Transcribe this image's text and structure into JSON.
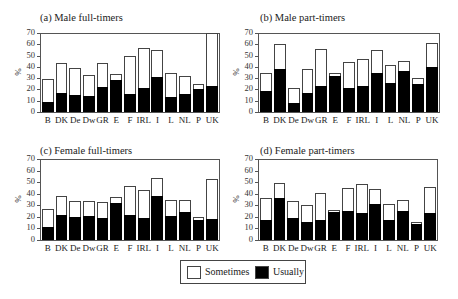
{
  "legend": {
    "sometimes_label": "Sometimes",
    "usually_label": "Usually",
    "sometimes_color": "#ffffff",
    "usually_color": "#000000"
  },
  "chart_data": [
    {
      "type": "bar",
      "stacked": true,
      "title": "(a) Male full-timers",
      "xlabel": "",
      "ylabel": "%",
      "ylim": [
        0,
        70
      ],
      "yticks": [
        0,
        10,
        20,
        30,
        40,
        50,
        60,
        70
      ],
      "categories": [
        "B",
        "DK",
        "De",
        "Dw",
        "GR",
        "E",
        "F",
        "IRL",
        "I",
        "L",
        "NL",
        "P",
        "UK"
      ],
      "series": [
        {
          "name": "Usually",
          "values": [
            9,
            17,
            15,
            14,
            22,
            28,
            16,
            21,
            31,
            13,
            16,
            20,
            23
          ]
        },
        {
          "name": "Sometimes",
          "values": [
            20,
            26,
            24,
            19,
            21,
            6,
            34,
            36,
            24,
            22,
            16,
            5,
            47
          ]
        }
      ],
      "totals": [
        29,
        43,
        39,
        33,
        43,
        34,
        50,
        57,
        55,
        35,
        32,
        25,
        70
      ]
    },
    {
      "type": "bar",
      "stacked": true,
      "title": "(b) Male part-timers",
      "xlabel": "",
      "ylabel": "%",
      "ylim": [
        0,
        70
      ],
      "yticks": [
        0,
        10,
        20,
        30,
        40,
        50,
        60,
        70
      ],
      "categories": [
        "B",
        "DK",
        "De",
        "Dw",
        "GR",
        "E",
        "F",
        "IRL",
        "I",
        "L",
        "NL",
        "P",
        "UK"
      ],
      "series": [
        {
          "name": "Usually",
          "values": [
            19,
            38,
            8,
            17,
            23,
            32,
            21,
            23,
            35,
            26,
            36,
            25,
            40
          ]
        },
        {
          "name": "Sometimes",
          "values": [
            16,
            22,
            13,
            21,
            33,
            3,
            23,
            24,
            20,
            16,
            9,
            5,
            21
          ]
        }
      ],
      "totals": [
        35,
        60,
        21,
        38,
        56,
        35,
        44,
        47,
        55,
        42,
        45,
        30,
        61
      ]
    },
    {
      "type": "bar",
      "stacked": true,
      "title": "(c) Female full-timers",
      "xlabel": "",
      "ylabel": "%",
      "ylim": [
        0,
        70
      ],
      "yticks": [
        0,
        10,
        20,
        30,
        40,
        50,
        60,
        70
      ],
      "categories": [
        "B",
        "DK",
        "De",
        "Dw",
        "GR",
        "E",
        "F",
        "IRL",
        "I",
        "L",
        "NL",
        "P",
        "UK"
      ],
      "series": [
        {
          "name": "Usually",
          "values": [
            11,
            22,
            20,
            21,
            19,
            32,
            22,
            19,
            38,
            21,
            24,
            17,
            18
          ]
        },
        {
          "name": "Sometimes",
          "values": [
            16,
            16,
            14,
            13,
            14,
            5,
            25,
            24,
            16,
            14,
            11,
            3,
            35
          ]
        }
      ],
      "totals": [
        27,
        38,
        34,
        34,
        33,
        37,
        47,
        43,
        54,
        35,
        35,
        20,
        53
      ]
    },
    {
      "type": "bar",
      "stacked": true,
      "title": "(d) Female part-timers",
      "xlabel": "",
      "ylabel": "%",
      "ylim": [
        0,
        70
      ],
      "yticks": [
        0,
        10,
        20,
        30,
        40,
        50,
        60,
        70
      ],
      "categories": [
        "B",
        "DK",
        "De",
        "Dw",
        "GR",
        "E",
        "F",
        "IRL",
        "I",
        "L",
        "NL",
        "P",
        "UK"
      ],
      "series": [
        {
          "name": "Usually",
          "values": [
            17,
            36,
            19,
            16,
            17,
            24,
            25,
            23,
            31,
            17,
            25,
            14,
            23
          ]
        },
        {
          "name": "Sometimes",
          "values": [
            19,
            13,
            15,
            14,
            24,
            2,
            20,
            25,
            13,
            14,
            10,
            2,
            23
          ]
        }
      ],
      "totals": [
        36,
        49,
        34,
        30,
        41,
        26,
        45,
        48,
        44,
        31,
        35,
        16,
        46
      ]
    }
  ]
}
